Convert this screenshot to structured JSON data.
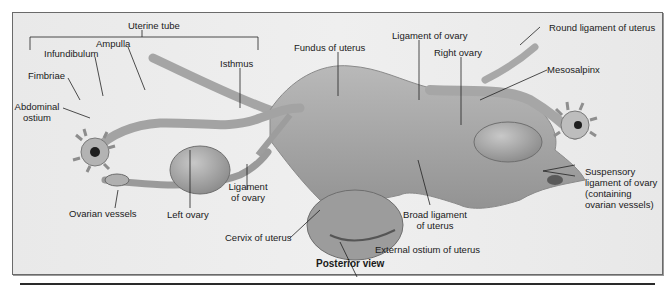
{
  "figure": {
    "view_caption": "Posterior view",
    "labels": {
      "uterine_tube": "Uterine tube",
      "ampulla": "Ampulla",
      "infundibulum": "Infundibulum",
      "fimbriae": "Fimbriae",
      "abdominal_ostium_1": "Abdominal",
      "abdominal_ostium_2": "ostium",
      "isthmus": "Isthmus",
      "fundus_of_uterus": "Fundus of uterus",
      "ligament_of_ovary_top": "Ligament of ovary",
      "right_ovary": "Right ovary",
      "round_ligament_of_uterus": "Round ligament of uterus",
      "mesosalpinx": "Mesosalpinx",
      "suspensory_1": "Suspensory",
      "suspensory_2": "ligament of ovary",
      "suspensory_3": "(containing",
      "suspensory_4": "ovarian vessels)",
      "broad_ligament_1": "Broad ligament",
      "broad_ligament_2": "of uterus",
      "external_ostium": "External ostium of uterus",
      "cervix_of_uterus": "Cervix of uterus",
      "ligament_of_ovary_bottom_1": "Ligament",
      "ligament_of_ovary_bottom_2": "of ovary",
      "left_ovary": "Left ovary",
      "ovarian_vessels": "Ovarian vessels"
    },
    "colors": {
      "background": "#ececec",
      "tissue": "#a9a9a9",
      "tissue_dark": "#7d7d7d",
      "leader_line": "#222222"
    }
  }
}
